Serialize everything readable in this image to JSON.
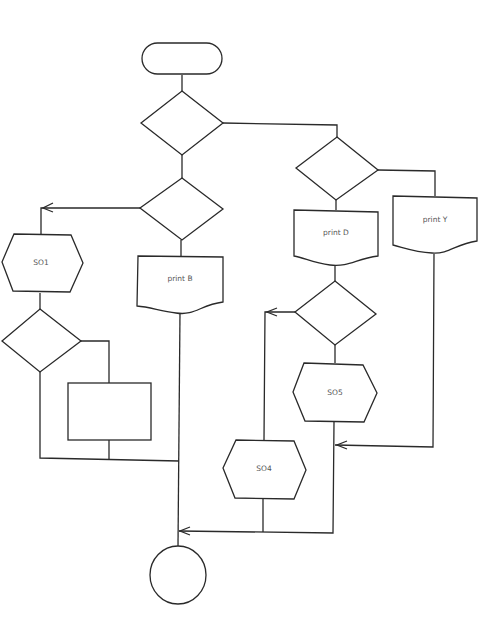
{
  "diagram": {
    "type": "flowchart",
    "colors": {
      "stroke": "#2a2a2a",
      "label": "#555555",
      "background": "#ffffff"
    },
    "nodes": {
      "start": {
        "shape": "terminator",
        "label": ""
      },
      "decision_top": {
        "shape": "decision",
        "label": ""
      },
      "decision_left": {
        "shape": "decision",
        "label": ""
      },
      "decision_right": {
        "shape": "decision",
        "label": ""
      },
      "so1": {
        "shape": "preparation",
        "label": "SO1"
      },
      "print_b": {
        "shape": "document",
        "label": "print B"
      },
      "print_d": {
        "shape": "document",
        "label": "print D"
      },
      "print_y": {
        "shape": "document",
        "label": "print Y"
      },
      "decision_so1": {
        "shape": "decision",
        "label": ""
      },
      "process_box": {
        "shape": "process",
        "label": ""
      },
      "decision_d": {
        "shape": "decision",
        "label": ""
      },
      "so5": {
        "shape": "preparation",
        "label": "SO5"
      },
      "so4": {
        "shape": "preparation",
        "label": "SO4"
      },
      "end": {
        "shape": "connector",
        "label": ""
      }
    }
  }
}
